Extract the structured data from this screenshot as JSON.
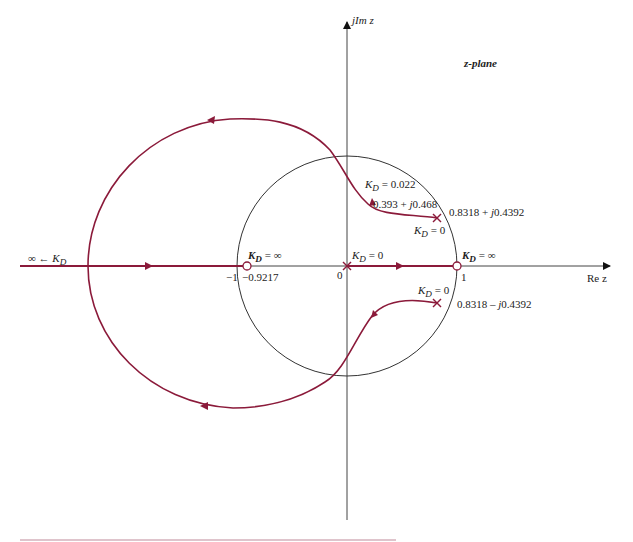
{
  "diagram": {
    "title": "z-plane",
    "type": "root locus",
    "axes": {
      "imag_label": "jIm z",
      "real_label": "Re z",
      "origin_label": "0",
      "minus_one_label": "-1",
      "one_label": "1"
    },
    "unit_circle": true,
    "poles": [
      {
        "label": "K_D = 0",
        "value": "0",
        "position": "origin"
      },
      {
        "label": "K_D = 0",
        "value": "0.8318 + j0.4392"
      },
      {
        "label": "K_D = 0",
        "value": "0.8318 - j0.4392"
      }
    ],
    "zeros": [
      {
        "label": "K_D = ∞",
        "value": "-0.9217"
      },
      {
        "label": "K_D = ∞",
        "value": "1"
      }
    ],
    "annotations": {
      "crossing_gain": "K_D = 0.022",
      "crossing_point": "0.393 + j0.468",
      "infinity_branch": "∞ ← K_D"
    },
    "colors": {
      "locus": "#8b1a3a",
      "axes": "#333333",
      "circle": "#333333"
    }
  },
  "labels": {
    "zplane": "z-plane",
    "jim": "jIm z",
    "rez": "Re z",
    "zero": "0",
    "neg1": "−1",
    "neg09217": "−0.9217",
    "one": "1",
    "kd_inf_left": "= ∞",
    "kd_inf_right": "= ∞",
    "kd0_origin": "= 0",
    "kd0_upper": "= 0",
    "kd0_lower": "= 0",
    "kd_022": "= 0.022",
    "pt_cross": "0.393 + ",
    "pt_cross_j": "j",
    "pt_cross_tail": "0.468",
    "pole_up": "0.8318 + ",
    "pole_up_j": "j",
    "pole_up_tail": "0.4392",
    "pole_dn": "0.8318 – ",
    "pole_dn_j": "j",
    "pole_dn_tail": "0.4392",
    "inf_arrow": "∞ ← "
  }
}
